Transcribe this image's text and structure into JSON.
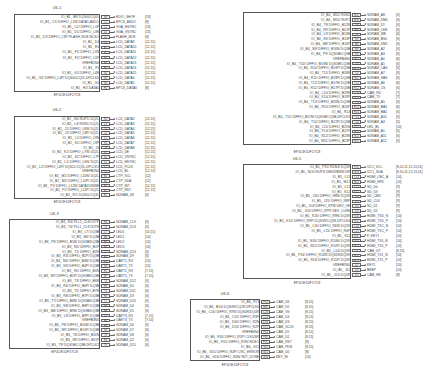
{
  "blocks": [
    {
      "id": "U6-1",
      "title": "U6-1",
      "part": "EP4CE10F17C8",
      "x": 14,
      "y": 14,
      "w": 86,
      "h": 78,
      "pinx": 101,
      "titleY": 5,
      "partY": 93,
      "rows": [
        {
          "label": "IO_B1_ B9/ DQS0UCQ0L",
          "pin": "B9",
          "net": "EDIO_SHOF",
          "ref": "[13]"
        },
        {
          "label": "IO_B1_ C1/ DIFFIO_L1N/ DATA1,ASDO",
          "pin": "C1",
          "net": "EPCS_ASDO",
          "ref": "[8]"
        },
        {
          "label": "IO_B1_ C2/ DIFFIO_L1P",
          "pin": "C2",
          "net": "VGA_HSYNC",
          "ref": "[13]"
        },
        {
          "label": "IO_B1_ D1/ DIFFIO_L3N",
          "pin": "D1",
          "net": "VGA_VSYNC",
          "ref": "[13]"
        },
        {
          "label": "IO_B1_ D2/ DIFFIO_L3P/ FLASH_NCE,NCSO",
          "pin": "D2",
          "net": "FLASH_NCE",
          "ref": "[8]"
        },
        {
          "label": "IO_B1_ D4",
          "pin": "D4",
          "net": "LCD_DATA9",
          "ref": "[12,15]"
        },
        {
          "label": "IO_B1_ E5",
          "pin": "E5",
          "net": "LCD_DATA10",
          "ref": "[12,15]"
        },
        {
          "label": "IO_B1_ F1/ DIFFIO_L5N",
          "pin": "F1",
          "net": "LCD_DATA11",
          "ref": "[12,15]"
        },
        {
          "label": "IO_B1_ F2/ DIFFIO_L5P",
          "pin": "F2",
          "net": "LCD_DATA12",
          "ref": "[12,15]"
        },
        {
          "label": "VREFB1N0",
          "pin": "F3",
          "net": "LCD_DATA13",
          "ref": "[12,15]"
        },
        {
          "label": "IO_B1_ F5",
          "pin": "F5",
          "net": "LCD_DATA14",
          "ref": "[12,15]"
        },
        {
          "label": "IO_B1_ G1/ DIFFIO_L4N",
          "pin": "G1",
          "net": "LCD_DATA15",
          "ref": "[12,15]"
        },
        {
          "label": "IO_B1_ G2/ DIFFIO_L4P/ DQS0UCQ0L,DPCLK0",
          "pin": "G2",
          "net": "LCD_DATA0",
          "ref": "[12,15]"
        },
        {
          "label": "IO_B1_ G5",
          "pin": "G5",
          "net": "LCD_DATA1",
          "ref": "[12,15]"
        },
        {
          "label": "IO_B1_ H2/ DATA0",
          "pin": "H2",
          "net": "EPCS_DATA0",
          "ref": "[8]"
        }
      ]
    },
    {
      "id": "U6-2",
      "title": "U6-2",
      "part": "EP4CE10F17C8",
      "x": 14,
      "y": 116,
      "w": 86,
      "h": 83,
      "pinx": 101,
      "titleY": 107,
      "partY": 200,
      "rows": [
        {
          "label": "IO_B2_ K6/ RUP1/ DQ2L",
          "pin": "K6",
          "net": "LCD_DATA2",
          "ref": "[12,15]"
        },
        {
          "label": "IO_B2_ L4/ RDN1/ DQ2L",
          "pin": "L4",
          "net": "LCD_DATA3",
          "ref": "[12,15]"
        },
        {
          "label": "IO_B2_ J1/ DIFFIO_L8N/ DQ2L",
          "pin": "J1",
          "net": "LCD_DATA4",
          "ref": "[12,15]"
        },
        {
          "label": "IO_B2_ J2/ DIFFIO_L8P/ DQ2L",
          "pin": "J2",
          "net": "LCD_DATA5",
          "ref": "[12,15]"
        },
        {
          "label": "IO_B2_ L1/ DIFFIO_L9N",
          "pin": "L1",
          "net": "LCD_DATA6",
          "ref": "[12,15]"
        },
        {
          "label": "IO_B2_ K5/ DIFFIO_L9P",
          "pin": "K5",
          "net": "LCD_DATA7",
          "ref": "[12,15]"
        },
        {
          "label": "IO_B2_ J6",
          "pin": "J6",
          "net": "LCD_DATA8",
          "ref": "[12,15]"
        },
        {
          "label": "IO_B2_ K1/ DIFFIO_L7N/ DQ2L",
          "pin": "K1",
          "net": "LCD_DE",
          "ref": "[12,15]"
        },
        {
          "label": "IO_B2_ K2/ DIFFIO_L7P",
          "pin": "K2",
          "net": "LCD_VSYNC",
          "ref": "[12,15]"
        },
        {
          "label": "IO_B2_ L1/ DIFFIO_L6N/ DQ2L",
          "pin": "L1",
          "net": "LCD_HSYNC",
          "ref": "[12,15]"
        },
        {
          "label": "IO_B2_ L2/ DIFFIO_L6P/ DQS2L/CQ3L,DPCLK1",
          "pin": "L2",
          "net": "LCD_PCLK",
          "ref": "[12,15]"
        },
        {
          "label": "VREFB2N0",
          "pin": "L3",
          "net": "LCD_BL",
          "ref": "[12,15]"
        },
        {
          "label": "IO_B2_ M1/ DIFFIO_L10N/ DQ2L",
          "pin": "M1",
          "net": "CTP_SCL",
          "ref": "[12]"
        },
        {
          "label": "IO_B2_ M2/ DIFFIO_L10P/ DQ2L",
          "pin": "M2",
          "net": "CTP_SDA",
          "ref": "[12]"
        },
        {
          "label": "IO_B2_ P1/ DIFFIO_L12N/ DATA15/NWE",
          "pin": "P1",
          "net": "CTP_INT",
          "ref": "[12,15]"
        },
        {
          "label": "IO_B2_ P2/ DIFFIO_L12P/ DQ2L",
          "pin": "P2",
          "net": "CTP_RST",
          "ref": "[12,15]"
        },
        {
          "label": "IO_B2_ R1/ DQS0L/CQ3L",
          "pin": "R1",
          "net": "SDRAM_D8",
          "ref": "[6]"
        }
      ]
    },
    {
      "id": "U6-3",
      "title": "U6-3",
      "part": "EP4CE10F17C8",
      "x": 9,
      "y": 219,
      "w": 91,
      "h": 130,
      "pinx": 101,
      "titleY": 211,
      "partY": 350,
      "rows": [
        {
          "label": "IO_B3_ R4/ PLL1_CLKOUTP",
          "pin": "R4",
          "net": "SDRAM_CLK",
          "ref": "[6]"
        },
        {
          "label": "IO_B3_ T4/ PLL1_CLKOUTN",
          "pin": "T4",
          "net": "SDRAM_D13",
          "ref": "[6]"
        },
        {
          "label": "IO_B3_ L7/ DQ3B",
          "pin": "L7",
          "net": "LED0",
          "ref": "[10,15]"
        },
        {
          "label": "IO_B3_ M6/ DQ3B",
          "pin": "M6",
          "net": "LED1",
          "ref": "[10]"
        },
        {
          "label": "IO_B3_ P3/ DIFFIO_B1N/ DQS3B/DQ3B",
          "pin": "P3",
          "net": "LED2",
          "ref": "[10]"
        },
        {
          "label": "IO_B3_ N5/ DIFFIO_B1P",
          "pin": "N5",
          "net": "LED3",
          "ref": "[10]"
        },
        {
          "label": "IO_B3_ T2/ DIFFIO_B2N",
          "pin": "T2",
          "net": "SDRAM_D14",
          "ref": "[6]"
        },
        {
          "label": "IO_B3_ R3/ DIFFIO_B2P/ DQ3B",
          "pin": "R3",
          "net": "SDRAM_D9",
          "ref": "[6]"
        },
        {
          "label": "IO_B3_ N6/ DIFFIO_B4N/ DQ3B",
          "pin": "N6",
          "net": "UART1_RX",
          "ref": "[15]"
        },
        {
          "label": "IO_B3_ N3/ DIFFIO_B4P/ DQ3B",
          "pin": "N3",
          "net": "UART1_TX",
          "ref": "[15]"
        },
        {
          "label": "IO_B3_ R5/ DIFFIO_B5N",
          "pin": "R5",
          "net": "UART2_RX",
          "ref": "[7,15]"
        },
        {
          "label": "IO_B3_ M7/ DIFFIO_B5P/ DQS3B/DQ3B",
          "pin": "M7",
          "net": "UART2_TX",
          "ref": "[7,15]"
        },
        {
          "label": "IO_B3_ T3/ DIFFIO_B6N",
          "pin": "T3",
          "net": "SDRAM_D12",
          "ref": "[6]"
        },
        {
          "label": "IO_B3_ R6/ DIFFIO_B6P/ DQ3B",
          "pin": "R6",
          "net": "SDRAM_D0",
          "ref": "[6]"
        },
        {
          "label": "IO_B3_ T5/ DIFFIO_B7N",
          "pin": "T5",
          "net": "SDRAM_D11",
          "ref": "[6]"
        },
        {
          "label": "IO_B3_ R8/ DIFFIO_B7P/ DQ3B",
          "pin": "R8",
          "net": "SDRAM_D3",
          "ref": "[6]"
        },
        {
          "label": "IO_B3_ T7/ DIFFIO_B8N/ DQS3B/DQ3B",
          "pin": "T7",
          "net": "SDRAM_D10",
          "ref": "[6]"
        },
        {
          "label": "IO_B3_ N8/ DIFFIO_B8P/ DQ3B",
          "pin": "N8",
          "net": "SDRAM_D4",
          "ref": "[6]"
        },
        {
          "label": "IO_B3_ M8/ DIFFIO_B9N/ DQS3B/DQ3B",
          "pin": "M8",
          "net": "SDRAM_D5",
          "ref": "[6]"
        },
        {
          "label": "IO_B3_ L8/ DIFFIO_B9P/ DQ3B",
          "pin": "L8",
          "net": "UART3_RX",
          "ref": "[7,15]"
        },
        {
          "label": "VREFB3N0",
          "pin": "P6",
          "net": "UART3_TX",
          "ref": "[7,15]"
        },
        {
          "label": "IO_B3_ P8/ DIFFIO_B10N/ DQ3B",
          "pin": "P8",
          "net": "SDRAM_D6",
          "ref": "[6]"
        },
        {
          "label": "IO_B3_ N9/ DIFFIO_B10P/ DQ3B",
          "pin": "N9",
          "net": "SDRAM_D7",
          "ref": "[6]"
        },
        {
          "label": "IO_B3_ T8/ DIFFIO_B11N",
          "pin": "T8",
          "net": "SDRAM_D8",
          "ref": "[6]"
        },
        {
          "label": "IO_B3_ R8/ DIFFIO_B11P",
          "pin": "R8",
          "net": "SDRAM_D2",
          "ref": "[6]"
        },
        {
          "label": "IO_B3_ T9/ DQS5B/CQ3B,DPCLK2",
          "pin": "T9",
          "net": "SDRAM_D15",
          "ref": "[6]"
        }
      ]
    },
    {
      "id": "U6-4",
      "title": "U6-4",
      "part": "EP4CE10F17C8",
      "x": 23,
      "y": 12,
      "w": 0,
      "h": 0,
      "skip": true,
      "rows": []
    },
    {
      "id": "U6-B4",
      "title": "",
      "part": "EP4CE10F17C8",
      "x": 243,
      "y": 12,
      "w": 108,
      "h": 133,
      "pinx": 352,
      "titleY": 4,
      "partY": 150,
      "rows": [
        {
          "label": "IO_B4_ M11/ RDN2",
          "pin": "M11",
          "net": "SDRAM_A8",
          "ref": "[6]"
        },
        {
          "label": "IO_B4_ M10/ RUP2",
          "pin": "M10",
          "net": "SDRAM_DM0",
          "ref": "[6]"
        },
        {
          "label": "IO_B4_ T9/ DIFFIO_B12N",
          "pin": "T9",
          "net": "SDRAM_D1",
          "ref": "[6]"
        },
        {
          "label": "IO_B4_ R9/ DIFFIO_B12P",
          "pin": "R9",
          "net": "SDRAM_CKE",
          "ref": "[6]"
        },
        {
          "label": "IO_B4_ L9/ DIFFIO_B13N",
          "pin": "L9",
          "net": "SDRAM_WE",
          "ref": "[6]"
        },
        {
          "label": "IO_B4_ K9/ DIFFIO_B13P",
          "pin": "K9",
          "net": "SDRAM_BS0",
          "ref": "[6]"
        },
        {
          "label": "IO_B4_ M9/ DIFFIO_B14P",
          "pin": "M9",
          "net": "SDRAM_DM1",
          "ref": "[6]"
        },
        {
          "label": "IO_B4_ N9/ DIFFIO_B16N/ DQ5B",
          "pin": "N9",
          "net": "SDRAM_A2",
          "ref": "[6]"
        },
        {
          "label": "IO_B4_ P9/ DQS5B/CQ5B",
          "pin": "P9",
          "net": "SDRAM_A3",
          "ref": "[6]"
        },
        {
          "label": "VREFB4N0",
          "pin": "N11",
          "net": "SDRAM_A0",
          "ref": "[6]"
        },
        {
          "label": "IO_B4_ T10/ DIFFIO_B16N/ DQS5B/CQ5B",
          "pin": "T10",
          "net": "SDRAM_A1",
          "ref": "[6]"
        },
        {
          "label": "IO_B4_ R10/ DIFFIO_B16P/ DQ5B",
          "pin": "R10",
          "net": "SDRAM_CAS",
          "ref": "[6]"
        },
        {
          "label": "IO_B4_ T11/ DIFFIO_B18N",
          "pin": "T11",
          "net": "SDRAM_A7",
          "ref": "[6]"
        },
        {
          "label": "IO_B4_ R11/ DIFFIO_B18P/ DQ5B",
          "pin": "R11",
          "net": "SDRAM_RAS",
          "ref": "[6]"
        },
        {
          "label": "IO_B4_ T12/ DIFFIO_B17N/ DQ5B",
          "pin": "T12",
          "net": "SDRAM_A6",
          "ref": "[6]"
        },
        {
          "label": "IO_B4_ R12/ DIFFIO_B17P/ DQ5B",
          "pin": "R12",
          "net": "SDRAM_CS",
          "ref": "[6]"
        },
        {
          "label": "IO_B4_ L10/ DIFFIO_B19N",
          "pin": "L10",
          "net": "CAM_RS",
          "ref": "[7]"
        },
        {
          "label": "IO_B4_ K10/ DIFFIO_B19P",
          "pin": "K10",
          "net": "CAM_T5",
          "ref": "[7]"
        },
        {
          "label": "IO_B4_ T13/ DIFFIO_B20N/ DQ5B",
          "pin": "T13",
          "net": "SDRAM_A5",
          "ref": "[6]"
        },
        {
          "label": "IO_B4_ R13/ DIFFIO_B20P",
          "pin": "R13",
          "net": "SDRAM_BA0",
          "ref": "[6]"
        },
        {
          "label": "IO_B4_ R14",
          "pin": "R14",
          "net": "SDRAM_BA1",
          "ref": "[6]"
        },
        {
          "label": "IO_B4_ T15/ DIFFIO_B22N/ DQS5B/CQ5B,DPCLK3",
          "pin": "T15",
          "net": "SDRAM_A10",
          "ref": "[6]"
        },
        {
          "label": "IO_B4_ T14/ DIFFIO_B22P/ DQ5B",
          "pin": "T14",
          "net": "SDRAM_A4",
          "ref": "[6]"
        },
        {
          "label": "IO_B4_ L11/ DIFFIO_B21N",
          "pin": "L11",
          "net": "LED_BL",
          "ref": "[10]"
        },
        {
          "label": "IO_B4_ P14/ DIFFIO_B21P",
          "pin": "P14",
          "net": "SDRAM_A1",
          "ref": "[6]"
        },
        {
          "label": "IO_B4_ N12/ DIFFIO_B23N",
          "pin": "N12",
          "net": "SDRAM_A11",
          "ref": "[6]"
        },
        {
          "label": "IO_B4_ M11/ DIFFIO_B23P",
          "pin": "M11",
          "net": "SDRAM_A12",
          "ref": "[6]"
        }
      ]
    },
    {
      "id": "U6-5",
      "title": "U6-5",
      "part": "EP4CE10F17C8",
      "x": 243,
      "y": 164,
      "w": 108,
      "h": 115,
      "pinx": 352,
      "titleY": 156,
      "partY": 281,
      "rows": [
        {
          "label": "IO_B5_ P15/ RDN3/ DQ5R",
          "pin": "P15",
          "net": "I2C1_SCL",
          "ref": "[8,10,11,12,13,14]"
        },
        {
          "label": "IO_B5_ N16/ RUP3/ DM5R/BWS#5R",
          "pin": "N16",
          "net": "I2C1_SDA",
          "ref": "[8,10,11,12,13,14]"
        },
        {
          "label": "IO_B5_ L13",
          "pin": "L13",
          "net": "HDMI_CEC_A",
          "ref": "[14]"
        },
        {
          "label": "IO_B5_ M12",
          "pin": "M12",
          "net": "HDMI_HPD",
          "ref": "[14]"
        },
        {
          "label": "IO_B5_ L12",
          "pin": "L12",
          "net": "SD_D0",
          "ref": "[9]"
        },
        {
          "label": "IO_B5_ K12",
          "pin": "K12",
          "net": "SD_D3",
          "ref": "[9]"
        },
        {
          "label": "IO_B5_ J16/ DIFFIO_R8N/ DQ5R",
          "pin": "J16",
          "net": "SD_CMD",
          "ref": "[9]"
        },
        {
          "label": "IO_B5_ J15/ DIFFIO_R8P",
          "pin": "J15",
          "net": "SD_CLK",
          "ref": "[9]"
        },
        {
          "label": "IO_B5_ J14/ DIFFIO_R7N/ DEV_OE",
          "pin": "J14",
          "net": "SD_D1",
          "ref": "[9]"
        },
        {
          "label": "IO_B5_ J13/ DIFFIO_R7P/ DEV_CLRN",
          "pin": "J13",
          "net": "SD_D2",
          "ref": "[9]"
        },
        {
          "label": "IO_B5_ K16/ DIFFIO_R9N/ DQ5R",
          "pin": "K16",
          "net": "HDMI_TXD_N",
          "ref": "[14]"
        },
        {
          "label": "IO_B5_ K15/ DIFFIO_R9P/ DQS5R/CQ5R,DPCLK4",
          "pin": "K15",
          "net": "HDMI_TXD_P",
          "ref": "[14]"
        },
        {
          "label": "IO_B5_ L16/ DIFFIO_R6N/ DQ5R",
          "pin": "L16",
          "net": "HDMI_TXC_N",
          "ref": "[14]"
        },
        {
          "label": "IO_B5_ L15/ DIFFIO_R6P",
          "pin": "L15",
          "net": "HDMI_TXC_P",
          "ref": "[14]"
        },
        {
          "label": "IO_B5_ K11",
          "pin": "K11",
          "net": "F_KEY1",
          "ref": "[10]"
        },
        {
          "label": "IO_B5_ N16/ DIFFIO_R10N/ DQ5R",
          "pin": "N16",
          "net": "HDMI_TX0_N",
          "ref": "[14]"
        },
        {
          "label": "IO_B5_ N15/ DIFFIO_R10P/ DQ5R",
          "pin": "N15",
          "net": "HDMI_TX0_P",
          "ref": "[14]"
        },
        {
          "label": "IO_B5_ L14/ DQ5R",
          "pin": "L14",
          "net": "CAM_D7",
          "ref": "[8,15]"
        },
        {
          "label": "IO_B5_ P16/ DIFFIO_R11N/ DQS5R/DQ5R",
          "pin": "P16",
          "net": "HDMI_TX1_N",
          "ref": "[14]"
        },
        {
          "label": "IO_B5_ R16/ DIFFIO_R11P/ DQ5R",
          "pin": "R16",
          "net": "HDMI_TX1_P",
          "ref": "[14]"
        },
        {
          "label": "VREFB5N0",
          "pin": "J11",
          "net": "KEY1",
          "ref": "[10]"
        },
        {
          "label": "IO_B5_ J11",
          "pin": "J12",
          "net": "BEEP",
          "ref": "[10]"
        },
        {
          "label": "IO_B5_ J15/ DQ5R",
          "pin": "J15",
          "net": "CAM_HS",
          "ref": "[8]"
        }
      ]
    },
    {
      "id": "U6-6",
      "title": "U6-6",
      "part": "EP4CE10F17C8",
      "x": 190,
      "y": 299,
      "w": 70,
      "h": 62,
      "pinx": 261,
      "titleY": 291,
      "partY": 363,
      "rows": [
        {
          "label": "IO_B6_ F13",
          "pin": "F13",
          "net": "CAM_D6",
          "ref": "[8,15]"
        },
        {
          "label": "IO_B6_ B16/ DQS0R/CQ1R,DPCLK6",
          "pin": "B16",
          "net": "CAM_D5",
          "ref": "[8,15]"
        },
        {
          "label": "IO_B6_ C16/ DIFFIO_R7N/ DQS0R/DQ0R",
          "pin": "C16",
          "net": "CAM_VS",
          "ref": "[8,15]"
        },
        {
          "label": "IO_B6_ C15/ DIFFIO_R3P",
          "pin": "C15",
          "net": "CAM_D4",
          "ref": "[8,15]"
        },
        {
          "label": "IO_B6_ D16/ DIFFIO_R2N",
          "pin": "D16",
          "net": "CAM_D3",
          "ref": "[8,15]"
        },
        {
          "label": "IO_B6_ D15/ DIFFIO_R2P",
          "pin": "D15",
          "net": "CAM_XCLK",
          "ref": "[8,15]"
        },
        {
          "label": "VREFB6N0",
          "pin": "F14",
          "net": "CAM_D2",
          "ref": "[8,15]"
        },
        {
          "label": "IO_B6_ F16/ DIFFIO_R5P/ CLKUSR",
          "pin": "F16",
          "net": "CAM_D1",
          "ref": "[8,15]"
        },
        {
          "label": "IO_B6_ F15/ DIFFIO_R5N/ NCEO",
          "pin": "F15",
          "net": "CAM_RST",
          "ref": "[8]"
        },
        {
          "label": "IO_B6_ G11",
          "pin": "G11",
          "net": "CAM_PDN",
          "ref": "[8,15]"
        },
        {
          "label": "IO_B6_ G15/ DIFFIO_R4P/ CRC_ERROR",
          "pin": "G15",
          "net": "CAM_D0",
          "ref": "[8]"
        },
        {
          "label": "IO_B6_ G16/ DIFFIO_R4N/ INIT_DONE",
          "pin": "G16",
          "net": "KEY_IN",
          "ref": "[10]"
        }
      ]
    }
  ],
  "page": {
    "background": "#ffffff",
    "line_color": "#555555",
    "text_color": "#444444"
  }
}
